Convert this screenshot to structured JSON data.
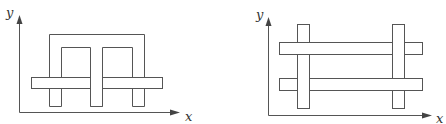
{
  "figures": [
    {
      "name": "left-figure",
      "description": "U-shaped bracket with three legs interlocked with a horizontal bar",
      "axis_labels": {
        "x": "x",
        "y": "y"
      }
    },
    {
      "name": "right-figure",
      "description": "Two vertical bars woven with two horizontal bars",
      "axis_labels": {
        "x": "x",
        "y": "y"
      }
    }
  ],
  "colors": {
    "stroke": "#555555",
    "fill": "#ffffff",
    "background": "#ffffff"
  }
}
